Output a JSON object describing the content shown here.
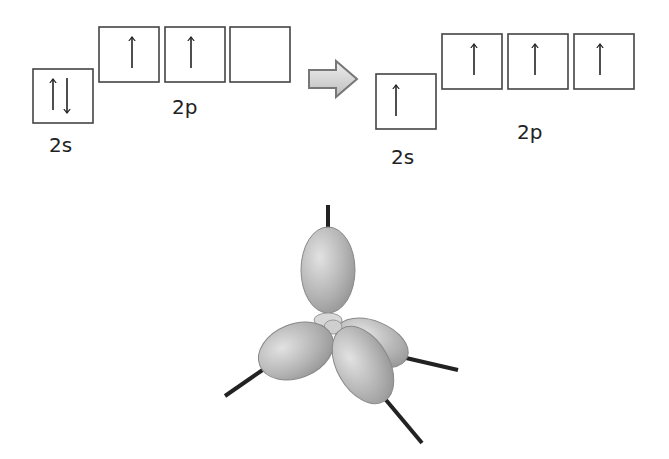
{
  "diagram": {
    "ground_state": {
      "s_label": "2s",
      "p_label": "2p",
      "s_orbital": [
        "up",
        "down"
      ],
      "p_orbitals": [
        [
          "up"
        ],
        [
          "up"
        ],
        []
      ]
    },
    "transition_arrow": "right-arrow",
    "excited_state": {
      "s_label": "2s",
      "p_label": "2p",
      "s_orbital": [
        "up"
      ],
      "p_orbitals": [
        [
          "up"
        ],
        [
          "up"
        ],
        [
          "up"
        ]
      ]
    },
    "hybrid_orbital_model": {
      "lobes": 4,
      "bonds": 4,
      "color": "#9a9a9a"
    }
  }
}
